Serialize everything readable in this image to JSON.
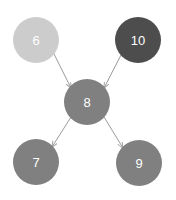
{
  "diagram": {
    "type": "directed-graph",
    "background_color": "#ffffff",
    "edge_color": "#9a9a9a",
    "edge_width": 1,
    "label_color": "#ffffff",
    "node_radius": 23,
    "nodes": [
      {
        "id": "6",
        "label": "6",
        "cx": 36,
        "cy": 40,
        "r": 23,
        "fill": "#cccccc",
        "font_size": 13
      },
      {
        "id": "10",
        "label": "10",
        "cx": 138,
        "cy": 40,
        "r": 23,
        "fill": "#4d4d4d",
        "font_size": 13
      },
      {
        "id": "8",
        "label": "8",
        "cx": 87,
        "cy": 102,
        "r": 23,
        "fill": "#808080",
        "font_size": 13
      },
      {
        "id": "7",
        "label": "7",
        "cx": 36,
        "cy": 162,
        "r": 23,
        "fill": "#808080",
        "font_size": 13
      },
      {
        "id": "9",
        "label": "9",
        "cx": 139,
        "cy": 163,
        "r": 23,
        "fill": "#808080",
        "font_size": 13
      }
    ],
    "edges": [
      {
        "id": "edge-6-8",
        "from": "6",
        "to": "8",
        "x1": 54,
        "y1": 54,
        "x2": 71,
        "y2": 88
      },
      {
        "id": "edge-10-8",
        "from": "10",
        "to": "8",
        "x1": 121,
        "y1": 55,
        "x2": 104,
        "y2": 88
      },
      {
        "id": "edge-8-7",
        "from": "8",
        "to": "7",
        "x1": 71,
        "y1": 117,
        "x2": 52,
        "y2": 147
      },
      {
        "id": "edge-8-9",
        "from": "8",
        "to": "9",
        "x1": 104,
        "y1": 117,
        "x2": 123,
        "y2": 148
      }
    ]
  }
}
